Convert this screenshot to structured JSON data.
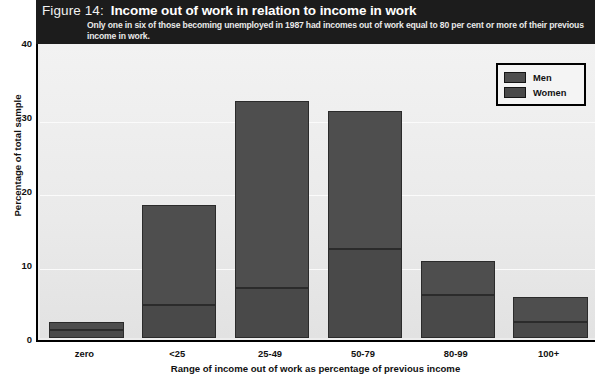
{
  "header": {
    "figure_label": "Figure 14:",
    "title": "Income out of work in relation to income in work",
    "subtitle": "Only one in six of those becoming unemployed in 1987 had incomes out of work equal to 80 per cent or more of their previous income in work."
  },
  "legend": {
    "items": [
      {
        "label": "Men",
        "color": "#4e4e4e"
      },
      {
        "label": "Women",
        "color": "#494949"
      }
    ]
  },
  "axes": {
    "y_label": "Percentage of total sample",
    "y_ticks": [
      "0",
      "10",
      "20",
      "30",
      "40"
    ],
    "x_label": "Range of income out of work as percentage of previous income",
    "x_ticks": [
      "zero",
      "<25",
      "25-49",
      "50-79",
      "80-99",
      "100+"
    ]
  },
  "chart_data": {
    "type": "bar",
    "stacked": true,
    "title": "Income out of work in relation to income in work",
    "subtitle": "Only one in six of those becoming unemployed in 1987 had incomes out of work equal to 80 per cent or more of their previous income in work.",
    "xlabel": "Range of income out of work as percentage of previous income",
    "ylabel": "Percentage of total sample",
    "categories": [
      "zero",
      "<25",
      "25-49",
      "50-79",
      "80-99",
      "100+"
    ],
    "series": [
      {
        "name": "Women",
        "values": [
          1.1,
          4.5,
          6.8,
          12.0,
          5.8,
          2.2
        ],
        "color": "#494949"
      },
      {
        "name": "Men",
        "values": [
          1.0,
          13.5,
          25.2,
          18.7,
          4.6,
          3.3
        ],
        "color": "#4e4e4e"
      }
    ],
    "totals": [
      2.1,
      18.0,
      32.0,
      30.7,
      10.4,
      5.5
    ],
    "ylim": [
      0,
      40
    ],
    "ytick_values": [
      0,
      10,
      20,
      30,
      40
    ],
    "grid": true,
    "legend_position": "top-right"
  }
}
